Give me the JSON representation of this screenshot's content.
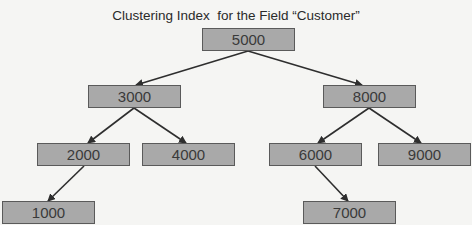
{
  "title": "Clustering Index  for the Field “Customer”",
  "nodes": {
    "root": "5000",
    "left": "3000",
    "right": "8000",
    "left_left": "2000",
    "left_right": "4000",
    "right_left": "6000",
    "right_right": "9000",
    "left_left_left": "1000",
    "right_left_right": "7000"
  },
  "edges": [
    {
      "from": "5000",
      "to": "3000"
    },
    {
      "from": "5000",
      "to": "8000"
    },
    {
      "from": "3000",
      "to": "2000"
    },
    {
      "from": "3000",
      "to": "4000"
    },
    {
      "from": "8000",
      "to": "6000"
    },
    {
      "from": "8000",
      "to": "9000"
    },
    {
      "from": "2000",
      "to": "1000"
    },
    {
      "from": "6000",
      "to": "7000"
    }
  ],
  "colors": {
    "node_fill": "#a9a9a9",
    "node_border": "#5a5a5a",
    "edge": "#2e2e2e",
    "background": "#f5f5f3"
  }
}
